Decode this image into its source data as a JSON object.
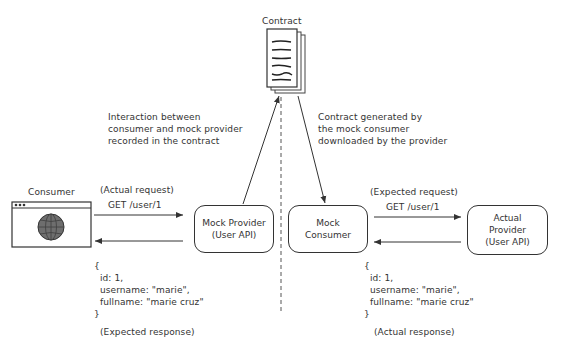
{
  "contract": {
    "label": "Contract",
    "icon": "document-stack-icon"
  },
  "annotations": {
    "left": "Interaction between\nconsumer and mock provider\nrecorded in the contract",
    "right": "Contract generated by\nthe mock consumer\ndownloaded by the provider"
  },
  "consumer": {
    "label": "Consumer",
    "icon": "browser-globe-icon"
  },
  "left_flow": {
    "request_label": "(Actual request)",
    "request_path": "GET /user/1",
    "response_body": "{\n  id: 1,\n  username: \"marie\",\n  fullname: \"marie cruz\"\n}",
    "response_label": "(Expected response)"
  },
  "mock_provider": {
    "label": "Mock Provider\n(User API)"
  },
  "mock_consumer": {
    "label": "Mock\nConsumer"
  },
  "actual_provider": {
    "label": "Actual\nProvider\n(User API)"
  },
  "right_flow": {
    "request_label": "(Expected request)",
    "request_path": "GET /user/1",
    "response_body": "{\n  id: 1,\n  username: \"marie\",\n  fullname: \"marie cruz\"\n}",
    "response_label": "(Actual response)"
  },
  "colors": {
    "stroke": "#333333",
    "globe_fill": "#6e6e6e",
    "background": "#ffffff"
  }
}
